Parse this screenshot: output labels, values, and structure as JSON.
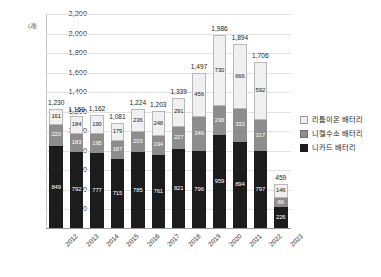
{
  "chart_data": {
    "type": "bar",
    "subtype": "stacked-vertical",
    "title": "",
    "xlabel": "",
    "ylabel": "",
    "yunit": "(개)",
    "ylim": [
      0,
      2200
    ],
    "ytick_step": 200,
    "yticks": [
      "200",
      "400",
      "600",
      "800",
      "1,000",
      "1,200",
      "1,400",
      "1,600",
      "1,800",
      "2,000",
      "2,200"
    ],
    "grid": true,
    "legend_position": "right",
    "categories": [
      "2012",
      "2013",
      "2014",
      "2015",
      "2016",
      "2017",
      "2018",
      "2019",
      "2020",
      "2021",
      "2022",
      "2023"
    ],
    "series": [
      {
        "name": "니카드 배터리",
        "color": "#1c1c1c",
        "values": [
          849,
          792,
          777,
          715,
          785,
          761,
          821,
          796,
          959,
          894,
          797,
          226
        ]
      },
      {
        "name": "니켈수소 배터리",
        "color": "#8d8d8d",
        "values": [
          220,
          183,
          195,
          187,
          203,
          194,
          227,
          346,
          296,
          333,
          317,
          88
        ]
      },
      {
        "name": "리튬이온 배터리",
        "color": "#f0f0f0",
        "values": [
          161,
          184,
          190,
          179,
          236,
          248,
          291,
          456,
          730,
          666,
          592,
          146
        ]
      }
    ],
    "totals": [
      "1,230",
      "1,159",
      "1,162",
      "1,081",
      "1,224",
      "1,203",
      "1,339",
      "1,497",
      "1,986",
      "1,894",
      "1,706",
      "459"
    ],
    "segment_labels": {
      "nicd": [
        "849",
        "792",
        "777",
        "715",
        "785",
        "761",
        "821",
        "796",
        "959",
        "894",
        "797",
        "226"
      ],
      "nimh": [
        "220",
        "183",
        "195",
        "187",
        "203",
        "194",
        "227",
        "346",
        "296",
        "333",
        "317",
        "88"
      ],
      "lithium": [
        "161",
        "184",
        "190",
        "179",
        "236",
        "248",
        "291",
        "456",
        "730",
        "666",
        "592",
        "146"
      ]
    }
  },
  "legend": {
    "items": [
      {
        "label": "리튬이온 배터리",
        "swatch": "sw-lithium"
      },
      {
        "label": "니켈수소 배터리",
        "swatch": "sw-nimh"
      },
      {
        "label": "니카드 배터리",
        "swatch": "sw-nicd"
      }
    ]
  }
}
